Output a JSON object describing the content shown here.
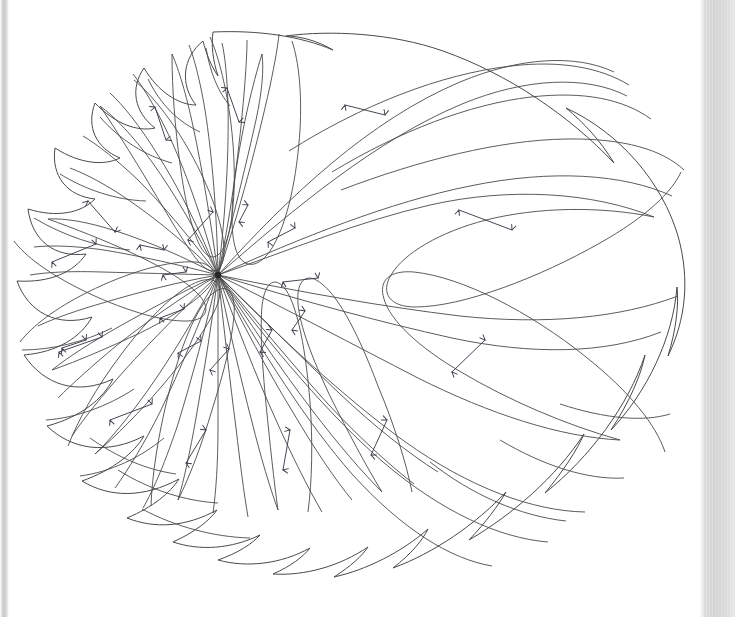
{
  "figure": {
    "kind": "phase-portrait",
    "title": "",
    "caption": "",
    "background_color": "#ffffff",
    "line_color": "#4a4a4a",
    "arrow_color": "#3c3c4a",
    "singular_point_color": "#262626",
    "scan_edge_color": "#d6d6d6"
  },
  "chart_data": {
    "type": "scatter",
    "title": "",
    "xlabel": "",
    "ylabel": "",
    "xlim": [
      0,
      735
    ],
    "ylim": [
      617,
      0
    ],
    "grid": false,
    "legend": "none",
    "singular_point": {
      "x": 218,
      "y": 275,
      "label": "",
      "radius": 3.2
    },
    "boundary_bumps": 13,
    "elliptic_sectors": 8,
    "hyperbolic_sectors": 9,
    "separatrix_count": 17,
    "arrows": [
      {
        "x1": 155,
        "y1": 107,
        "x2": 166,
        "y2": 140,
        "both_heads": true
      },
      {
        "x1": 227,
        "y1": 88,
        "x2": 239,
        "y2": 122,
        "both_heads": true
      },
      {
        "x1": 345,
        "y1": 105,
        "x2": 385,
        "y2": 115,
        "both_heads": true
      },
      {
        "x1": 459,
        "y1": 210,
        "x2": 512,
        "y2": 230,
        "both_heads": true
      },
      {
        "x1": 88,
        "y1": 201,
        "x2": 115,
        "y2": 232,
        "both_heads": true
      },
      {
        "x1": 52,
        "y1": 262,
        "x2": 96,
        "y2": 244,
        "both_heads": true
      },
      {
        "x1": 59,
        "y1": 352,
        "x2": 102,
        "y2": 337,
        "both_heads": true
      },
      {
        "x1": 110,
        "y1": 420,
        "x2": 152,
        "y2": 404,
        "both_heads": true
      },
      {
        "x1": 186,
        "y1": 463,
        "x2": 206,
        "y2": 430,
        "both_heads": true
      },
      {
        "x1": 283,
        "y1": 470,
        "x2": 290,
        "y2": 430,
        "both_heads": true
      },
      {
        "x1": 371,
        "y1": 455,
        "x2": 387,
        "y2": 420,
        "both_heads": true
      },
      {
        "x1": 452,
        "y1": 372,
        "x2": 485,
        "y2": 340,
        "both_heads": true
      },
      {
        "x1": 188,
        "y1": 240,
        "x2": 213,
        "y2": 212,
        "both_heads": true
      },
      {
        "x1": 239,
        "y1": 222,
        "x2": 248,
        "y2": 205,
        "both_heads": true
      },
      {
        "x1": 268,
        "y1": 242,
        "x2": 295,
        "y2": 228,
        "both_heads": true
      },
      {
        "x1": 283,
        "y1": 282,
        "x2": 318,
        "y2": 278,
        "both_heads": true
      },
      {
        "x1": 292,
        "y1": 330,
        "x2": 305,
        "y2": 311,
        "both_heads": true
      },
      {
        "x1": 260,
        "y1": 352,
        "x2": 272,
        "y2": 330,
        "both_heads": true
      },
      {
        "x1": 210,
        "y1": 370,
        "x2": 229,
        "y2": 349,
        "both_heads": true
      },
      {
        "x1": 178,
        "y1": 353,
        "x2": 201,
        "y2": 341,
        "both_heads": true
      },
      {
        "x1": 160,
        "y1": 318,
        "x2": 184,
        "y2": 309,
        "both_heads": true
      },
      {
        "x1": 163,
        "y1": 275,
        "x2": 186,
        "y2": 272,
        "both_heads": true
      },
      {
        "x1": 140,
        "y1": 245,
        "x2": 164,
        "y2": 250,
        "both_heads": true
      },
      {
        "x1": 62,
        "y1": 348,
        "x2": 86,
        "y2": 340,
        "both_heads": true
      }
    ]
  },
  "page": {
    "width": 735,
    "height": 617
  }
}
